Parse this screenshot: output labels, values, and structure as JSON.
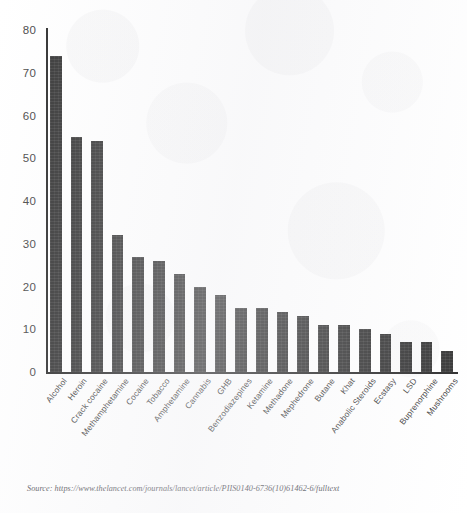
{
  "source_note": "Source: https://www.thelancet.com/journals/lancet/article/PIIS0140-6736(10)61462-6/fulltext",
  "style": {
    "bar_color": "#343434",
    "axis_color": "#2d2d2d",
    "tick_label_color": "#4a4a4a",
    "background": "#ffffff"
  },
  "chart_data": {
    "type": "bar",
    "title": "",
    "subtitle": "",
    "xlabel": "",
    "ylabel": "",
    "ylim": [
      0,
      80
    ],
    "yticks": [
      0,
      10,
      20,
      30,
      40,
      50,
      60,
      70,
      80
    ],
    "grid": false,
    "legend": "none",
    "categories": [
      "Alcohol",
      "Heroin",
      "Crack cocaine",
      "Methamphetamine",
      "Cocaine",
      "Tobacco",
      "Amphetamine",
      "Cannabis",
      "GHB",
      "Benzodiazepines",
      "Ketamine",
      "Methadone",
      "Mephedrone",
      "Butane",
      "Khat",
      "Anabolic Steroids",
      "Ecstasy",
      "LSD",
      "Buprenorphine",
      "Mushrooms"
    ],
    "values": [
      74,
      55,
      54,
      32,
      27,
      26,
      23,
      20,
      18,
      15,
      15,
      14,
      13,
      11,
      11,
      10,
      9,
      7,
      7,
      5
    ]
  }
}
